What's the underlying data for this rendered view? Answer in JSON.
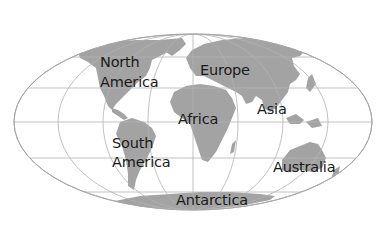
{
  "map": {
    "projection": "mollweide-world",
    "colors": {
      "background": "#ffffff",
      "land": "#a3a3a3",
      "grid": "#b3b3b3",
      "label": "#1a1a1a"
    },
    "labels": {
      "north_america": {
        "line1": "North",
        "line2": "America"
      },
      "europe": "Europe",
      "asia": "Asia",
      "africa": "Africa",
      "south_america": {
        "line1": "South",
        "line2": "America"
      },
      "australia": "Australia",
      "antarctica": "Antarctica"
    }
  }
}
